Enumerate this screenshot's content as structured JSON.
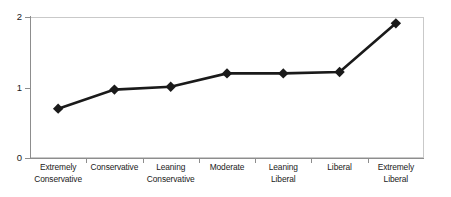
{
  "chart_data": {
    "type": "line",
    "title": "",
    "subtitle": "",
    "xlabel": "",
    "ylabel": "",
    "categories": [
      "Extremely Conservative",
      "Conservative",
      "Leaning Conservative",
      "Moderate",
      "Leaning Liberal",
      "Liberal",
      "Extremely Liberal"
    ],
    "category_lines": [
      [
        "Extremely",
        "Conservative"
      ],
      [
        "Conservative",
        ""
      ],
      [
        "Leaning",
        "Conservative"
      ],
      [
        "Moderate",
        ""
      ],
      [
        "Leaning",
        "Liberal"
      ],
      [
        "Liberal",
        ""
      ],
      [
        "Extremely",
        "Liberal"
      ]
    ],
    "values": [
      0.7,
      0.97,
      1.01,
      1.2,
      1.2,
      1.22,
      1.91
    ],
    "ylim": [
      0,
      2
    ],
    "ytick_labels": [
      "0",
      "1",
      "2"
    ],
    "ytick_values": [
      0,
      1,
      2
    ],
    "grid": false,
    "legend": false,
    "legend_position": "none",
    "marker": "diamond",
    "series": [
      {
        "name": "series-1",
        "values": [
          0.7,
          0.97,
          1.01,
          1.2,
          1.2,
          1.22,
          1.91
        ]
      }
    ]
  },
  "style": {
    "line_color": "#1a1a1a",
    "marker_color": "#1a1a1a",
    "axis_color": "#8d8d8d",
    "plot_border_color": "#c9c9c9",
    "background": "#ffffff",
    "text_color": "#1a1a1a"
  }
}
